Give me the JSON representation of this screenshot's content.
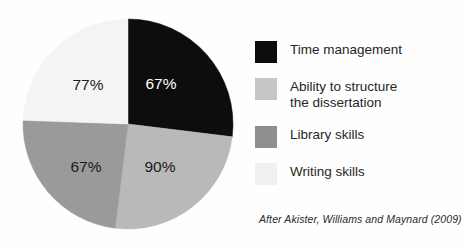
{
  "chart_data": {
    "type": "pie",
    "title": "",
    "xlabel": "",
    "ylabel": "",
    "legend_position": "right",
    "start_angle_deg": 0,
    "direction": "clockwise",
    "note": "Slice angles are drawn as near-equal quadrants; the printed percentages are independent survey values, not shares of the circle.",
    "categories": [
      "Time management",
      "Ability to structure the dissertation",
      "Library skills",
      "Writing skills"
    ],
    "values": [
      67,
      90,
      67,
      77
    ],
    "data_labels": [
      "67%",
      "90%",
      "67%",
      "77%"
    ],
    "colors": [
      "#0d0d0d",
      "#b9b9b9",
      "#9a9a9a",
      "#f4f4f4"
    ],
    "sweep_angles_deg": [
      97,
      90,
      85,
      88
    ]
  },
  "pie": {
    "center_x": 128,
    "center_y": 124,
    "radius": 105,
    "slices": [
      {
        "name": "time-management",
        "label": "67%",
        "color": "#0d0d0d",
        "label_color": "light",
        "start_deg": 0,
        "end_deg": 97,
        "label_x": 161,
        "label_y": 85
      },
      {
        "name": "ability-to-structure",
        "label": "90%",
        "color": "#b9b9b9",
        "label_color": "dark",
        "start_deg": 97,
        "end_deg": 187,
        "label_x": 160,
        "label_y": 168
      },
      {
        "name": "library-skills",
        "label": "67%",
        "color": "#9a9a9a",
        "label_color": "dark",
        "start_deg": 187,
        "end_deg": 272,
        "label_x": 86,
        "label_y": 168
      },
      {
        "name": "writing-skills",
        "label": "77%",
        "color": "#f4f4f4",
        "label_color": "dark",
        "start_deg": 272,
        "end_deg": 360,
        "label_x": 88,
        "label_y": 86
      }
    ]
  },
  "legend": {
    "items": [
      {
        "name": "time-management",
        "label": "Time management",
        "color": "#0d0d0d"
      },
      {
        "name": "ability-to-structure",
        "label": "Ability to structure\nthe dissertation",
        "color": "#c6c6c6"
      },
      {
        "name": "library-skills",
        "label": "Library skills",
        "color": "#8f8f8f"
      },
      {
        "name": "writing-skills",
        "label": "Writing skills",
        "color": "#f1f1f1"
      }
    ]
  },
  "attribution": {
    "text": "After Akister, Williams and Maynard (2009)"
  }
}
